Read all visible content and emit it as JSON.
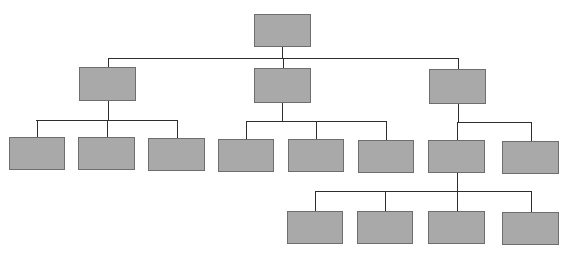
{
  "diagram": {
    "type": "org-chart",
    "colors": {
      "node_fill": "#a9a9a9",
      "node_border": "#6e6e6e",
      "connector": "#2e2e2e",
      "background": "#ffffff"
    },
    "nodes": [
      {
        "id": "root",
        "level": 1,
        "label": "",
        "x": 254,
        "y": 14,
        "w": 57,
        "h": 33
      },
      {
        "id": "a",
        "level": 2,
        "parent": "root",
        "label": "",
        "x": 79,
        "y": 67,
        "w": 57,
        "h": 34
      },
      {
        "id": "b",
        "level": 2,
        "parent": "root",
        "label": "",
        "x": 254,
        "y": 68,
        "w": 57,
        "h": 35
      },
      {
        "id": "c",
        "level": 2,
        "parent": "root",
        "label": "",
        "x": 429,
        "y": 69,
        "w": 57,
        "h": 35
      },
      {
        "id": "a1",
        "level": 3,
        "parent": "a",
        "label": "",
        "x": 9,
        "y": 137,
        "w": 56,
        "h": 33
      },
      {
        "id": "a2",
        "level": 3,
        "parent": "a",
        "label": "",
        "x": 78,
        "y": 137,
        "w": 57,
        "h": 33
      },
      {
        "id": "a3",
        "level": 3,
        "parent": "a",
        "label": "",
        "x": 148,
        "y": 138,
        "w": 57,
        "h": 33
      },
      {
        "id": "b1",
        "level": 3,
        "parent": "b",
        "label": "",
        "x": 218,
        "y": 139,
        "w": 56,
        "h": 33
      },
      {
        "id": "b2",
        "level": 3,
        "parent": "b",
        "label": "",
        "x": 288,
        "y": 139,
        "w": 56,
        "h": 33
      },
      {
        "id": "b3",
        "level": 3,
        "parent": "b",
        "label": "",
        "x": 358,
        "y": 140,
        "w": 56,
        "h": 33
      },
      {
        "id": "c1",
        "level": 3,
        "parent": "c",
        "label": "",
        "x": 428,
        "y": 140,
        "w": 57,
        "h": 33
      },
      {
        "id": "c2",
        "level": 3,
        "parent": "c",
        "label": "",
        "x": 502,
        "y": 141,
        "w": 57,
        "h": 33
      },
      {
        "id": "c1a",
        "level": 4,
        "parent": "c1",
        "label": "",
        "x": 287,
        "y": 211,
        "w": 56,
        "h": 33
      },
      {
        "id": "c1b",
        "level": 4,
        "parent": "c1",
        "label": "",
        "x": 357,
        "y": 211,
        "w": 56,
        "h": 33
      },
      {
        "id": "c1c",
        "level": 4,
        "parent": "c1",
        "label": "",
        "x": 428,
        "y": 211,
        "w": 57,
        "h": 33
      },
      {
        "id": "c1d",
        "level": 4,
        "parent": "c1",
        "label": "",
        "x": 502,
        "y": 212,
        "w": 57,
        "h": 33
      }
    ],
    "connectors": [
      {
        "from": "root",
        "bus_y": 58,
        "bus_x1": 108,
        "bus_x2": 458,
        "stem_x": 282
      },
      {
        "from": "a",
        "bus_y": 120,
        "bus_x1": 36,
        "bus_x2": 177,
        "stem_x": 108
      },
      {
        "from": "b",
        "bus_y": 121,
        "bus_x1": 246,
        "bus_x2": 386,
        "stem_x": 282
      },
      {
        "from": "c",
        "bus_y": 122,
        "bus_x1": 458,
        "bus_x2": 530,
        "stem_x": 458
      },
      {
        "from": "c1",
        "bus_y": 191,
        "bus_x1": 315,
        "bus_x2": 530,
        "stem_x": 457
      }
    ]
  }
}
